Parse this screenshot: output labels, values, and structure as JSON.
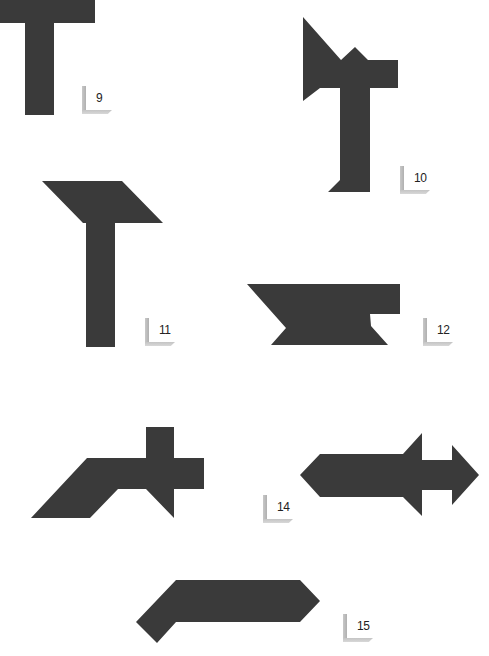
{
  "figure": {
    "shape_color": "#3a3a3a",
    "label_color": "#bdbdbd",
    "puzzles": [
      {
        "number": "9",
        "shape": "t-shape-cropped",
        "points": "0,0 95,0 95,23 54,23 54,115 25,115 25,23 0,23",
        "label_pos": {
          "x": 82,
          "y": 86
        }
      },
      {
        "number": "10",
        "shape": "t-with-flag",
        "points": "303,17 341,60 355,47 368,60 398,60 398,88 370,88 370,192 328,192 340,180 340,88 320,88 303,101",
        "label_pos": {
          "x": 400,
          "y": 166
        }
      },
      {
        "number": "11",
        "shape": "t-with-parallelogram-top",
        "points": "42,181 122,181 163,223 115,223 115,347 86,347 86,223 83,223",
        "label_pos": {
          "x": 145,
          "y": 318
        }
      },
      {
        "number": "12",
        "shape": "anvil",
        "points": "247,284 400,284 400,314 370,314 371,326 388,345 271,345 286,328",
        "label_pos": {
          "x": 423,
          "y": 318
        }
      },
      {
        "number": "13",
        "shape": "bent-cross",
        "points": "146,427 174,427 174,458 204,458 204,489 174,489 174,518 146,489 118,489 90,518 31,518 87,458 146,458",
        "label_pos": {
          "x": -30,
          "y": 482
        }
      },
      {
        "number": "14",
        "shape": "double-arrow",
        "points": "300,475 320,454 403,454 422,433 422,460 452,460 452,445 479,475 452,505 452,490 422,490 422,516 403,497 320,497",
        "label_pos": {
          "x": 263,
          "y": 495
        }
      },
      {
        "number": "15",
        "shape": "bent-pentagon-bar",
        "points": "176,580 300,580 320,601 300,622 176,622 157,643 136,622",
        "label_pos": {
          "x": 343,
          "y": 614
        }
      }
    ]
  }
}
